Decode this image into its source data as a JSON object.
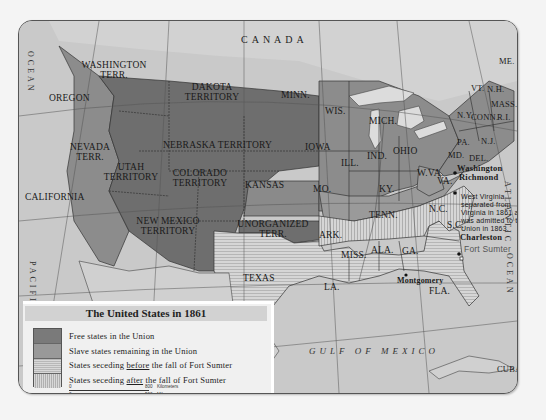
{
  "map": {
    "title": "The United States in 1861",
    "countries": {
      "north": "CANADA",
      "south": "MEXICO"
    },
    "water": {
      "pacific": "PACIFIC",
      "ocean_west": "OCEAN",
      "atlantic": "ATLANTIC",
      "ocean_east": "OCEAN",
      "gulf": "GULF OF MEXICO",
      "tropic": "Tropic of Cancer",
      "great_lakes": "Great Lakes"
    },
    "territories": {
      "washington": "WASHINGTON TERR.",
      "oregon": "OREGON",
      "dakota": "DAKOTA TERRITORY",
      "nebraska": "NEBRASKA TERRITORY",
      "nevada": "NEVADA TERR.",
      "utah": "UTAH TERRITORY",
      "colorado": "COLORADO TERRITORY",
      "california": "CALIFORNIA",
      "new_mexico": "NEW MEXICO TERRITORY",
      "kansas": "KANSAS",
      "unorganized": "UNORGANIZED TERR.",
      "texas": "TEXAS",
      "minn": "MINN.",
      "wis": "WIS.",
      "mich": "MICH.",
      "iowa": "IOWA",
      "ill": "ILL.",
      "ind": "IND.",
      "ohio": "OHIO",
      "mo": "MO.",
      "ky": "KY.",
      "wva": "W.VA.",
      "va": "VA.",
      "tenn": "TENN.",
      "nc": "N.C.",
      "sc": "S.C.",
      "ark": "ARK.",
      "miss": "MISS.",
      "ala": "ALA.",
      "ga": "GA.",
      "la": "LA.",
      "fla": "FLA.",
      "ny": "N.Y.",
      "pa": "PA.",
      "nj": "N.J.",
      "md": "MD.",
      "del": "DEL.",
      "me": "ME.",
      "vt": "VT.",
      "nh": "N.H.",
      "mass": "MASS.",
      "conn": "CONN.",
      "ri": "R.I.",
      "cuba": "CUBA"
    },
    "cities": {
      "washington": "Washington",
      "richmond": "Richmond",
      "charleston": "Charleston",
      "fort_sumter": "Fort Sumter",
      "montgomery": "Montgomery"
    },
    "annotation": "West Virginia separated from Virginia in 1861 and was admitted to the Union in 1863."
  },
  "legend": {
    "title": "The United States in 1861",
    "items": [
      {
        "key": "free",
        "label": "Free states in the Union",
        "color": "#7a7a7a"
      },
      {
        "key": "slave",
        "label": "Slave states remaining in the Union",
        "color": "#999999"
      },
      {
        "key": "before",
        "label_pre": "States seceding ",
        "label_em": "before",
        "label_post": " the fall of Fort Sumter",
        "pattern": "horizontal-stripes"
      },
      {
        "key": "after",
        "label_pre": "States seceding ",
        "label_em": "after",
        "label_post": " the fall of Fort Sumter",
        "pattern": "vertical-stripes"
      }
    ],
    "scale": {
      "km_zero": "0",
      "km_max": "800",
      "km_unit": "Kilometers",
      "mi_zero": "0",
      "mi_max": "500",
      "mi_unit": "Miles"
    }
  }
}
